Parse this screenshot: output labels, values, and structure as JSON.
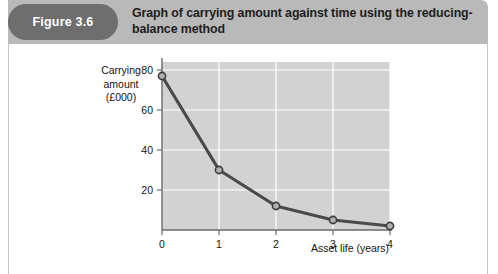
{
  "figure": {
    "pill_label": "Figure 3.6",
    "title": "Graph of carrying amount against time using the reducing-balance method",
    "pill_color": "#6e6e6e",
    "banner_color": "#b9b9b9",
    "title_color": "#1d1d1d"
  },
  "chart_data": {
    "type": "line",
    "title": "Graph of carrying amount against time using the reducing-balance method",
    "xlabel": "Asset life (years)",
    "ylabel": "Carrying amount (£000)",
    "ylabel_lines": [
      "Carrying",
      "amount",
      "(£000)"
    ],
    "x": [
      0,
      1,
      2,
      3,
      4
    ],
    "values": [
      77,
      30,
      12,
      5,
      2
    ],
    "series": [
      {
        "name": "Carrying amount",
        "values": [
          77,
          30,
          12,
          5,
          2
        ]
      }
    ],
    "xlim": [
      0,
      4
    ],
    "ylim": [
      0,
      84
    ],
    "xticks": [
      0,
      1,
      2,
      3,
      4
    ],
    "xtick_labels": [
      "0",
      "1",
      "2",
      "3",
      "4"
    ],
    "yticks": [
      20,
      40,
      60,
      80
    ],
    "ytick_labels": [
      "20",
      "40",
      "60",
      "80"
    ],
    "grid": true,
    "grid_color": "#ffffff",
    "plot_background": "#d2d2d2",
    "line_color": "#4a4a4a",
    "marker_face_color": "#b0b0b0",
    "marker_edge_color": "#3c3c3c",
    "axis_color": "#6a6a6a",
    "legend": null
  }
}
